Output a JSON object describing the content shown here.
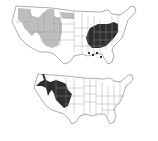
{
  "figure": {
    "caption_fragment": "",
    "maps": [
      {
        "id": "top",
        "description": "US map with western range shaded light gray and eastern range shaded dark, plus scattered Gulf Coast points",
        "legend": [],
        "colors": {
          "outline": "#8a8a8a",
          "land": "#ffffff",
          "light_range": "#bdbdbd",
          "dark_range": "#2e2e2e"
        }
      },
      {
        "id": "bottom",
        "description": "US map with Great Basin / Intermountain West range shaded dark",
        "legend": [],
        "colors": {
          "outline": "#8a8a8a",
          "land": "#ffffff",
          "dark_range": "#2e2e2e"
        }
      }
    ]
  }
}
